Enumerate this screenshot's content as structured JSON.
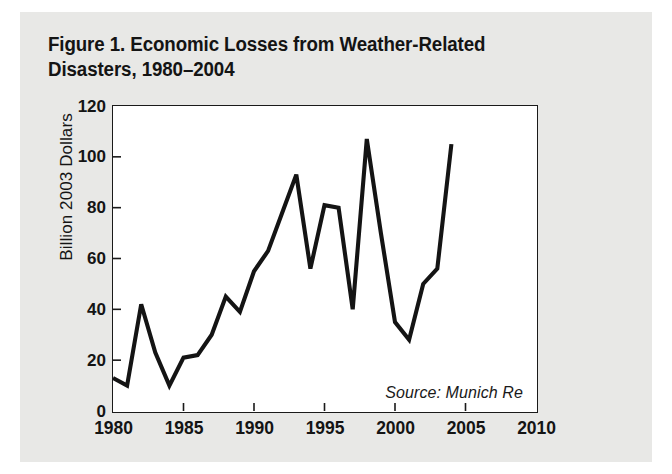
{
  "figure": {
    "title": "Figure 1. Economic Losses from Weather-Related\n                 Disasters, 1980–2004",
    "title_line1": "Figure 1. Economic Losses from Weather-Related",
    "title_line2": "Disasters, 1980–2004",
    "source": "Source: Munich Re",
    "panel_background": "#e8e8e6",
    "plot_background": "#ffffff",
    "line_color": "#141414",
    "axis_color": "#1a1a1a"
  },
  "chart_data": {
    "type": "line",
    "title": "Figure 1. Economic Losses from Weather-Related Disasters, 1980–2004",
    "xlabel": "",
    "ylabel": "Billion 2003 Dollars",
    "xlim": [
      1980,
      2010
    ],
    "ylim": [
      0,
      120
    ],
    "xticks": [
      1980,
      1985,
      1990,
      1995,
      2000,
      2005,
      2010
    ],
    "xtick_labels": [
      "1980",
      "1985",
      "1990",
      "1995",
      "2000",
      "2005",
      "2010"
    ],
    "yticks": [
      0,
      20,
      40,
      60,
      80,
      100,
      120
    ],
    "ytick_labels": [
      "0",
      "20",
      "40",
      "60",
      "80",
      "100",
      "120"
    ],
    "grid": false,
    "legend": false,
    "annotations": [
      "Source: Munich Re"
    ],
    "x": [
      1980,
      1981,
      1982,
      1983,
      1984,
      1985,
      1986,
      1987,
      1988,
      1989,
      1990,
      1991,
      1992,
      1993,
      1994,
      1995,
      1996,
      1997,
      1998,
      1999,
      2000,
      2001,
      2002,
      2003,
      2004
    ],
    "values": [
      13,
      10,
      42,
      23,
      10,
      21,
      22,
      30,
      45,
      39,
      55,
      63,
      78,
      93,
      56,
      81,
      80,
      40,
      107,
      70,
      35,
      28,
      50,
      56,
      105
    ],
    "series": [
      {
        "name": "Economic losses from weather-related disasters",
        "unit": "Billion 2003 Dollars",
        "values": [
          13,
          10,
          42,
          23,
          10,
          21,
          22,
          30,
          45,
          39,
          55,
          63,
          78,
          93,
          56,
          81,
          80,
          40,
          107,
          70,
          35,
          28,
          50,
          56,
          105
        ]
      }
    ]
  }
}
